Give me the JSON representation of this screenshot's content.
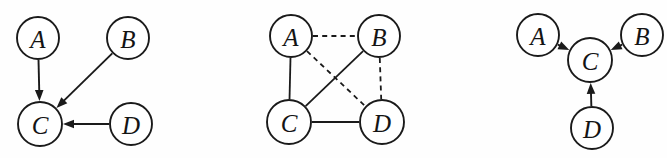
{
  "figure": {
    "background_color": "#fefefe",
    "stroke_color": "#1a1a1a",
    "width": 667,
    "height": 158,
    "panel_count": 3
  },
  "panels": [
    {
      "id": "panel-left",
      "kind": "directed-graph",
      "nodes": [
        {
          "id": "A",
          "label": "A",
          "cx": 38,
          "cy": 38,
          "r": 21
        },
        {
          "id": "B",
          "label": "B",
          "cx": 128,
          "cy": 38,
          "r": 21
        },
        {
          "id": "C",
          "label": "C",
          "cx": 40,
          "cy": 124,
          "r": 22
        },
        {
          "id": "D",
          "label": "D",
          "cx": 131,
          "cy": 124,
          "r": 21
        }
      ],
      "edges": [
        {
          "from": "A",
          "to": "C",
          "style": "solid",
          "directed": true
        },
        {
          "from": "B",
          "to": "C",
          "style": "solid",
          "directed": true
        },
        {
          "from": "D",
          "to": "C",
          "style": "solid",
          "directed": true
        }
      ]
    },
    {
      "id": "panel-middle",
      "kind": "mixed-graph",
      "nodes": [
        {
          "id": "A",
          "label": "A",
          "cx": 291,
          "cy": 36,
          "r": 21
        },
        {
          "id": "B",
          "label": "B",
          "cx": 379,
          "cy": 36,
          "r": 21
        },
        {
          "id": "C",
          "label": "C",
          "cx": 289,
          "cy": 122,
          "r": 22
        },
        {
          "id": "D",
          "label": "D",
          "cx": 382,
          "cy": 122,
          "r": 22
        }
      ],
      "edges": [
        {
          "from": "A",
          "to": "B",
          "style": "dashed",
          "directed": false
        },
        {
          "from": "A",
          "to": "C",
          "style": "solid",
          "directed": false
        },
        {
          "from": "A",
          "to": "D",
          "style": "dashed",
          "directed": false
        },
        {
          "from": "B",
          "to": "C",
          "style": "solid",
          "directed": false
        },
        {
          "from": "B",
          "to": "D",
          "style": "dashed",
          "directed": false
        },
        {
          "from": "C",
          "to": "D",
          "style": "solid",
          "directed": false
        }
      ]
    },
    {
      "id": "panel-right",
      "kind": "directed-graph",
      "nodes": [
        {
          "id": "A",
          "label": "A",
          "cx": 538,
          "cy": 35,
          "r": 21
        },
        {
          "id": "B",
          "label": "B",
          "cx": 642,
          "cy": 35,
          "r": 21
        },
        {
          "id": "C",
          "label": "C",
          "cx": 590,
          "cy": 60,
          "r": 22
        },
        {
          "id": "D",
          "label": "D",
          "cx": 592,
          "cy": 128,
          "r": 21
        }
      ],
      "edges": [
        {
          "from": "A",
          "to": "C",
          "style": "solid",
          "directed": true
        },
        {
          "from": "B",
          "to": "C",
          "style": "solid",
          "directed": true
        },
        {
          "from": "D",
          "to": "C",
          "style": "solid",
          "directed": true
        }
      ]
    }
  ]
}
